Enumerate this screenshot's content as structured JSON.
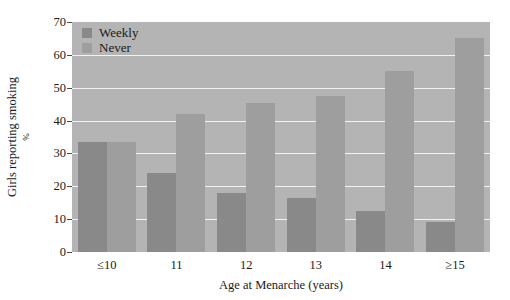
{
  "chart_data": {
    "type": "bar",
    "title": "",
    "xlabel": "Age at Menarche (years)",
    "ylabel": "Girls reporting smoking",
    "ylabel_unit": "%",
    "ylim": [
      0,
      70
    ],
    "yticks": [
      0,
      10,
      20,
      30,
      40,
      50,
      60,
      70
    ],
    "ytick_labels": [
      "0",
      "10",
      "20",
      "30",
      "40",
      "50",
      "60",
      "70"
    ],
    "grid": true,
    "grid_axis": "y",
    "legend_position": "top-left",
    "categories": [
      "≤10",
      "11",
      "12",
      "13",
      "14",
      "≥15"
    ],
    "series": [
      {
        "name": "Weekly",
        "color": "#898989",
        "values": [
          33.5,
          24,
          18,
          16.5,
          12.5,
          9
        ]
      },
      {
        "name": "Never",
        "color": "#9e9e9e",
        "values": [
          33.5,
          42,
          45.5,
          47.5,
          55,
          65
        ]
      }
    ],
    "plot_background": "#b4b4b4",
    "gridline_color": "#f2f2f2",
    "figure_background": "#ffffff"
  }
}
